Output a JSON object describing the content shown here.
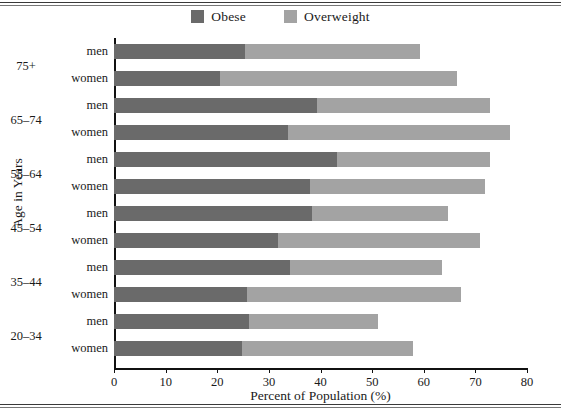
{
  "chart_data": {
    "type": "bar",
    "orientation": "horizontal",
    "stacked": true,
    "title": "",
    "xlabel": "Percent of Population (%)",
    "ylabel": "Age in Years",
    "xlim": [
      0,
      80
    ],
    "xticks": [
      0,
      10,
      20,
      30,
      40,
      50,
      60,
      70,
      80
    ],
    "xtick_labels": [
      "0",
      "10",
      "20",
      "30",
      "40",
      "50",
      "60",
      "70",
      "80"
    ],
    "grid": false,
    "legend_position": "top-center",
    "legend": [
      {
        "label": "Obese",
        "color": "#6a6a6a"
      },
      {
        "label": "Overweight",
        "color": "#a3a3a3"
      }
    ],
    "series": [
      {
        "name": "Obese",
        "color": "#6a6a6a",
        "values": [
          25.4,
          20.5,
          39.3,
          33.7,
          43.2,
          38.0,
          38.4,
          31.8,
          34.1,
          25.8,
          26.2,
          24.8
        ]
      },
      {
        "name": "Overweight",
        "color": "#a3a3a3",
        "values": [
          33.9,
          46.0,
          33.6,
          43.0,
          29.7,
          33.9,
          26.3,
          39.1,
          29.5,
          41.5,
          25.0,
          33.2
        ]
      }
    ],
    "totals": [
      59.3,
      66.5,
      72.9,
      76.7,
      72.9,
      71.9,
      64.7,
      70.9,
      63.6,
      67.3,
      51.2,
      58.0
    ],
    "groups": [
      {
        "age": "75+",
        "rows": [
          "men",
          "women"
        ]
      },
      {
        "age": "65–74",
        "rows": [
          "men",
          "women"
        ]
      },
      {
        "age": "55–64",
        "rows": [
          "men",
          "women"
        ]
      },
      {
        "age": "45–54",
        "rows": [
          "men",
          "women"
        ]
      },
      {
        "age": "35–44",
        "rows": [
          "men",
          "women"
        ]
      },
      {
        "age": "20–34",
        "rows": [
          "men",
          "women"
        ]
      }
    ],
    "categories": [
      "75+ men",
      "75+ women",
      "65–74 men",
      "65–74 women",
      "55–64 men",
      "55–64 women",
      "45–54 men",
      "45–54 women",
      "35–44 men",
      "35–44 women",
      "20–34 men",
      "20–34 women"
    ]
  },
  "colors": {
    "obese": "#6a6a6a",
    "overweight": "#a3a3a3",
    "axis": "#111111",
    "text": "#1a1a1a",
    "background": "#ffffff"
  }
}
